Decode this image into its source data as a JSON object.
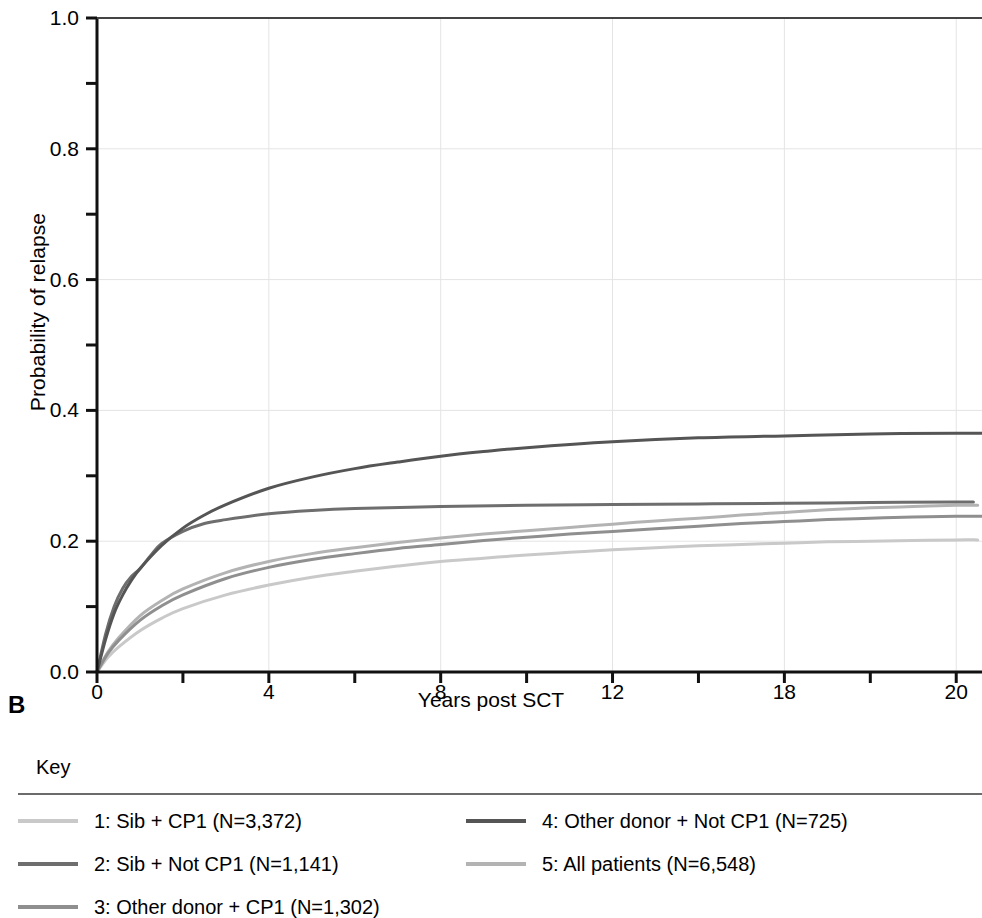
{
  "panel": {
    "label": "B"
  },
  "axes": {
    "y_title": "Probability of relapse",
    "x_title": "Years post SCT",
    "y_ticks": [
      "0.0",
      "0.2",
      "0.4",
      "0.6",
      "0.8",
      "1.0"
    ],
    "x_ticks": [
      "0",
      "4",
      "8",
      "12",
      "18",
      "20"
    ]
  },
  "legend": {
    "title": "Key",
    "items": [
      {
        "label": "1: Sib + CP1 (N=3,372)",
        "color": "#c9c9c9"
      },
      {
        "label": "2: Sib + Not CP1 (N=1,141)",
        "color": "#6e6e6e"
      },
      {
        "label": "3: Other donor + CP1 (N=1,302)",
        "color": "#8f8f8f"
      },
      {
        "label": "4: Other donor + Not CP1 (N=725)",
        "color": "#555555"
      },
      {
        "label": "5: All patients (N=6,548)",
        "color": "#b3b3b3"
      }
    ]
  },
  "chart_data": {
    "type": "line",
    "title": "",
    "xlabel": "Years post SCT",
    "ylabel": "Probability of relapse",
    "xlim": [
      0,
      20.6
    ],
    "ylim": [
      0,
      1.0
    ],
    "x_tick_values": [
      0,
      2,
      4,
      6,
      8,
      10,
      12,
      14,
      16,
      18,
      20
    ],
    "x_tick_labels": [
      "0",
      "",
      "4",
      "",
      "8",
      "",
      "12",
      "",
      "18",
      "",
      "20"
    ],
    "y_tick_values": [
      0.0,
      0.1,
      0.2,
      0.3,
      0.4,
      0.5,
      0.6,
      0.7,
      0.8,
      0.9,
      1.0
    ],
    "y_tick_labels": [
      "0.0",
      "",
      "0.2",
      "",
      "0.4",
      "",
      "0.6",
      "",
      "0.8",
      "",
      "1.0"
    ],
    "grid": true,
    "legend_position": "below",
    "series": [
      {
        "name": "1: Sib + CP1 (N=3,372)",
        "color": "#c9c9c9",
        "x": [
          0,
          0.25,
          0.5,
          1,
          1.5,
          2,
          3,
          4,
          5,
          6,
          7,
          8,
          9,
          10,
          11,
          12,
          13,
          14,
          15,
          16,
          17,
          18,
          19,
          20,
          20.5
        ],
        "y": [
          0,
          0.022,
          0.038,
          0.063,
          0.082,
          0.097,
          0.118,
          0.133,
          0.145,
          0.154,
          0.162,
          0.169,
          0.174,
          0.179,
          0.183,
          0.187,
          0.19,
          0.193,
          0.195,
          0.197,
          0.199,
          0.2,
          0.201,
          0.202,
          0.202
        ]
      },
      {
        "name": "2: Sib + Not CP1 (N=1,141)",
        "color": "#6e6e6e",
        "x": [
          0,
          0.2,
          0.4,
          0.6,
          0.8,
          1,
          1.25,
          1.5,
          2,
          2.5,
          3,
          4,
          5,
          6,
          8,
          10,
          12,
          14,
          16,
          18,
          20,
          20.4
        ],
        "y": [
          0,
          0.058,
          0.1,
          0.128,
          0.146,
          0.158,
          0.178,
          0.196,
          0.215,
          0.227,
          0.233,
          0.242,
          0.247,
          0.25,
          0.253,
          0.255,
          0.256,
          0.257,
          0.258,
          0.259,
          0.26,
          0.26
        ]
      },
      {
        "name": "3: Other donor + CP1 (N=1,302)",
        "color": "#8f8f8f",
        "x": [
          0,
          0.25,
          0.5,
          1,
          1.5,
          2,
          3,
          4,
          5,
          6,
          7,
          8,
          9,
          10,
          11,
          12,
          13,
          14,
          15,
          16,
          17,
          18,
          19,
          20,
          20.6
        ],
        "y": [
          0,
          0.028,
          0.048,
          0.079,
          0.101,
          0.118,
          0.143,
          0.16,
          0.172,
          0.181,
          0.189,
          0.195,
          0.201,
          0.206,
          0.211,
          0.215,
          0.219,
          0.223,
          0.227,
          0.23,
          0.233,
          0.235,
          0.237,
          0.238,
          0.238
        ]
      },
      {
        "name": "4: Other donor + Not CP1 (N=725)",
        "color": "#555555",
        "x": [
          0,
          0.2,
          0.4,
          0.6,
          0.8,
          1,
          1.5,
          2,
          2.5,
          3,
          4,
          5,
          6,
          7,
          8,
          9,
          10,
          12,
          14,
          16,
          18,
          20,
          20.6
        ],
        "y": [
          0,
          0.05,
          0.09,
          0.118,
          0.14,
          0.158,
          0.193,
          0.22,
          0.24,
          0.256,
          0.281,
          0.298,
          0.311,
          0.321,
          0.33,
          0.337,
          0.343,
          0.352,
          0.358,
          0.361,
          0.364,
          0.365,
          0.365
        ]
      },
      {
        "name": "5: All patients (N=6,548)",
        "color": "#b3b3b3",
        "x": [
          0,
          0.25,
          0.5,
          1,
          1.5,
          2,
          3,
          4,
          5,
          6,
          7,
          8,
          9,
          10,
          11,
          12,
          13,
          14,
          15,
          16,
          17,
          18,
          19,
          20,
          20.5
        ],
        "y": [
          0,
          0.03,
          0.052,
          0.086,
          0.109,
          0.127,
          0.152,
          0.169,
          0.181,
          0.19,
          0.198,
          0.205,
          0.211,
          0.216,
          0.221,
          0.226,
          0.231,
          0.235,
          0.24,
          0.244,
          0.248,
          0.251,
          0.253,
          0.255,
          0.255
        ]
      }
    ]
  }
}
